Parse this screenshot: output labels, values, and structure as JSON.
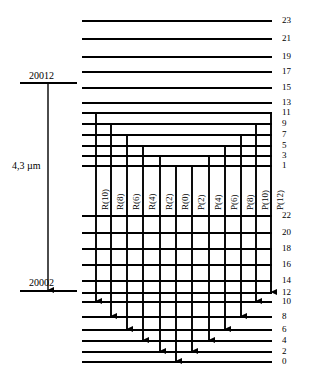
{
  "figure": {
    "kind": "energy-level-diagram",
    "wavelength_label": "4,3 µm",
    "upper_state_label": "20012",
    "lower_state_label": "20002"
  },
  "colors": {
    "line": "#000000",
    "background": "#ffffff",
    "text": "#000000"
  },
  "upper_block": {
    "levels": [
      23,
      21,
      19,
      17,
      15,
      13,
      11,
      9,
      7,
      5,
      3,
      1
    ],
    "y": [
      21,
      39,
      57,
      72,
      88,
      103,
      113,
      124,
      135,
      146,
      156,
      166
    ],
    "x_start": [
      82,
      82,
      82,
      82,
      82,
      82,
      82,
      82,
      82,
      82,
      82,
      82
    ],
    "x_end": 272
  },
  "lower_block": {
    "levels": [
      22,
      20,
      18,
      16,
      14,
      12,
      10,
      8,
      6,
      4,
      2,
      0
    ],
    "y": [
      216,
      233,
      249,
      265,
      281,
      293,
      302,
      317,
      330,
      341,
      352,
      362
    ],
    "x_start": 82,
    "x_end": 272
  },
  "transitions": [
    {
      "label": "R(10)",
      "x": 96,
      "upper_level": 11,
      "lower_level": 10,
      "branch": "R"
    },
    {
      "label": "R(8)",
      "x": 111,
      "upper_level": 9,
      "lower_level": 8,
      "branch": "R"
    },
    {
      "label": "R(6)",
      "x": 127,
      "upper_level": 7,
      "lower_level": 6,
      "branch": "R"
    },
    {
      "label": "R(4)",
      "x": 143,
      "upper_level": 5,
      "lower_level": 4,
      "branch": "R"
    },
    {
      "label": "R(2)",
      "x": 160,
      "upper_level": 3,
      "lower_level": 2,
      "branch": "R"
    },
    {
      "label": "R(0)",
      "x": 176,
      "upper_level": 1,
      "lower_level": 0,
      "branch": "R"
    },
    {
      "label": "P(2)",
      "x": 192,
      "upper_level": 1,
      "lower_level": 2,
      "branch": "P"
    },
    {
      "label": "P(4)",
      "x": 209,
      "upper_level": 3,
      "lower_level": 4,
      "branch": "P"
    },
    {
      "label": "P(6)",
      "x": 225,
      "upper_level": 5,
      "lower_level": 6,
      "branch": "P"
    },
    {
      "label": "P(8)",
      "x": 241,
      "upper_level": 7,
      "lower_level": 8,
      "branch": "P"
    },
    {
      "label": "P(10)",
      "x": 256,
      "upper_level": 9,
      "lower_level": 10,
      "branch": "P"
    },
    {
      "label": "P(12)",
      "x": 271,
      "upper_level": 11,
      "lower_level": 12,
      "branch": "P"
    }
  ],
  "wavelength_arrow": {
    "x": 48,
    "y_top": 83,
    "y_bottom": 290,
    "upper_tick": {
      "x1": 20,
      "x2": 77,
      "y": 83
    },
    "lower_tick": {
      "x1": 20,
      "x2": 77,
      "y": 291
    },
    "label_x": 12,
    "label_y": 160,
    "upper_label_x": 29,
    "upper_label_y": 70,
    "lower_label_x": 29,
    "lower_label_y": 277
  },
  "level_number_x": 282
}
